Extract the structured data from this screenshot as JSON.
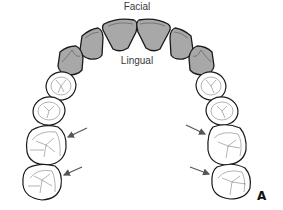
{
  "diagram": {
    "title_top": "Facial",
    "title_inner": "Lingual",
    "panel_letter": "A",
    "colors": {
      "anterior_fill": "#a8a8a8",
      "posterior_fill": "#ffffff",
      "outline": "#1a1a1a",
      "arrow": "#555555"
    },
    "teeth": {
      "anterior": [
        "central-incisor-left",
        "central-incisor-right",
        "lateral-incisor-left",
        "lateral-incisor-right",
        "canine-left",
        "canine-right"
      ],
      "posterior": [
        "premolar-1-left",
        "premolar-2-left",
        "molar-1-left",
        "molar-2-left",
        "premolar-1-right",
        "premolar-2-right",
        "molar-1-right",
        "molar-2-right"
      ]
    },
    "arrows_count": 4
  }
}
